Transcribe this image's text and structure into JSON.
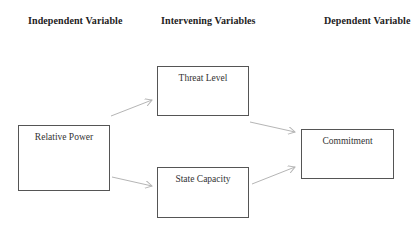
{
  "headers": {
    "independent": "Independent Variable",
    "intervening": "Intervening Variables",
    "dependent": "Dependent Variable"
  },
  "nodes": {
    "relative_power": "Relative Power",
    "threat_level": "Threat Level",
    "state_capacity": "State Capacity",
    "commitment": "Commitment"
  },
  "edges": [
    {
      "from": "Relative Power",
      "to": "Threat Level"
    },
    {
      "from": "Relative Power",
      "to": "State Capacity"
    },
    {
      "from": "Threat Level",
      "to": "Commitment"
    },
    {
      "from": "State Capacity",
      "to": "Commitment"
    }
  ],
  "colors": {
    "box_border": "#555555",
    "arrow": "#b5b5b5",
    "text": "#333333"
  }
}
